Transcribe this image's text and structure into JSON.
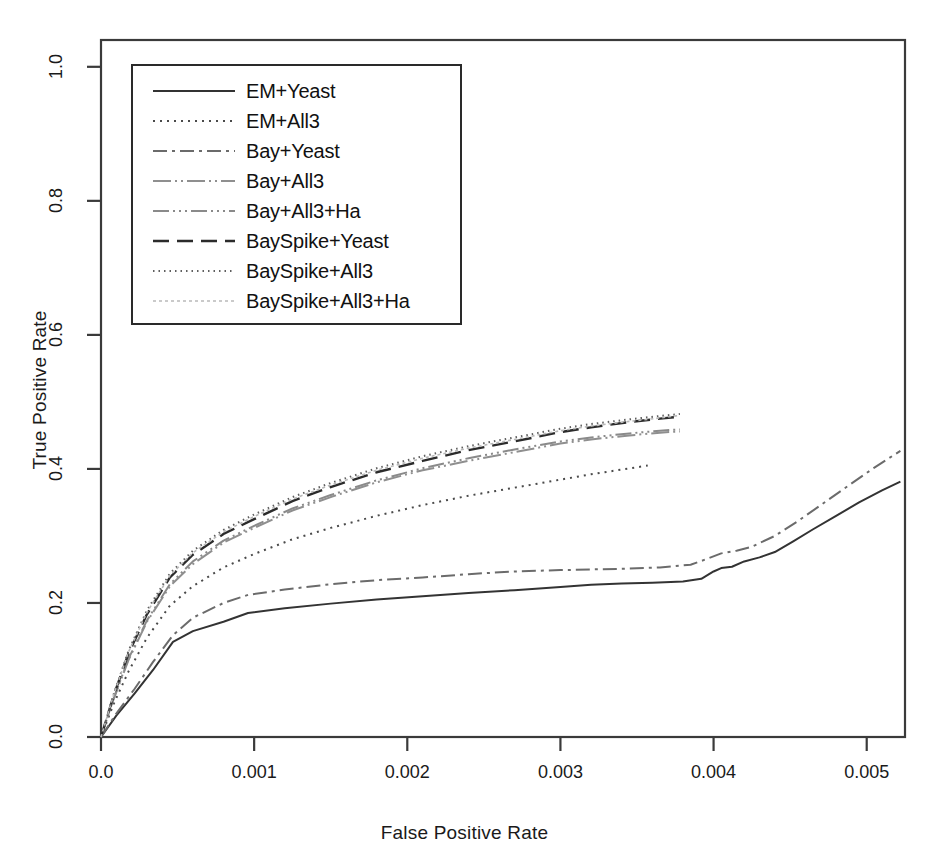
{
  "chart_data": {
    "type": "line",
    "title": "",
    "xlabel": "False Positive Rate",
    "ylabel": "True Positive Rate",
    "xlim": [
      0.0,
      0.00525
    ],
    "ylim": [
      0.0,
      1.04
    ],
    "grid": false,
    "legend_position": "top-left",
    "xticks": [
      0.0,
      0.001,
      0.002,
      0.003,
      0.004,
      0.005
    ],
    "xtick_labels": [
      "0.0",
      "0.001",
      "0.002",
      "0.003",
      "0.004",
      "0.005"
    ],
    "yticks": [
      0.0,
      0.2,
      0.4,
      0.6,
      0.8,
      1.0
    ],
    "ytick_labels": [
      "0.0",
      "0.2",
      "0.4",
      "0.6",
      "0.8",
      "1.0"
    ],
    "series": [
      {
        "name": "EM+Yeast",
        "style": "solid",
        "color": "#333333",
        "width": 2.0,
        "dash": "",
        "x": [
          0.0,
          0.0001,
          0.00022,
          0.00034,
          0.00047,
          0.0006,
          0.0008,
          0.00096,
          0.0012,
          0.0015,
          0.0018,
          0.0021,
          0.0024,
          0.0027,
          0.003,
          0.0032,
          0.0034,
          0.0036,
          0.0038,
          0.00392,
          0.004,
          0.00405,
          0.00412,
          0.0042,
          0.0043,
          0.0044,
          0.00452,
          0.00465,
          0.0048,
          0.00495,
          0.0051,
          0.00522
        ],
        "y": [
          0.0,
          0.032,
          0.065,
          0.1,
          0.142,
          0.158,
          0.172,
          0.185,
          0.192,
          0.199,
          0.205,
          0.21,
          0.215,
          0.219,
          0.224,
          0.227,
          0.229,
          0.23,
          0.232,
          0.236,
          0.247,
          0.252,
          0.254,
          0.262,
          0.268,
          0.276,
          0.292,
          0.31,
          0.33,
          0.35,
          0.368,
          0.381
        ]
      },
      {
        "name": "EM+All3",
        "style": "dotted",
        "color": "#4a4a4a",
        "width": 2.0,
        "dash": "2,5",
        "x": [
          0.0,
          8e-05,
          0.00018,
          0.0003,
          0.00045,
          0.0006,
          0.0008,
          0.001,
          0.00125,
          0.0015,
          0.0018,
          0.0021,
          0.0024,
          0.0027,
          0.003,
          0.0032,
          0.0034,
          0.00357
        ],
        "y": [
          0.0,
          0.048,
          0.098,
          0.148,
          0.196,
          0.225,
          0.253,
          0.273,
          0.295,
          0.312,
          0.33,
          0.346,
          0.36,
          0.372,
          0.384,
          0.392,
          0.399,
          0.405
        ]
      },
      {
        "name": "Bay+Yeast",
        "style": "dashdot",
        "color": "#6b6b6b",
        "width": 2.0,
        "dash": "14,5,3,5",
        "x": [
          0.0,
          0.0001,
          0.00022,
          0.00034,
          0.00047,
          0.0006,
          0.0008,
          0.00096,
          0.0012,
          0.0015,
          0.0018,
          0.0021,
          0.0024,
          0.0027,
          0.003,
          0.0032,
          0.0034,
          0.00365,
          0.00385,
          0.00396,
          0.00405,
          0.00415,
          0.00425,
          0.0044,
          0.00455,
          0.0047,
          0.00488,
          0.00505,
          0.00522
        ],
        "y": [
          0.0,
          0.035,
          0.072,
          0.112,
          0.152,
          0.178,
          0.2,
          0.212,
          0.22,
          0.228,
          0.234,
          0.238,
          0.243,
          0.247,
          0.249,
          0.25,
          0.251,
          0.253,
          0.257,
          0.266,
          0.274,
          0.278,
          0.284,
          0.3,
          0.322,
          0.346,
          0.375,
          0.402,
          0.427
        ]
      },
      {
        "name": "Bay+All3",
        "style": "longdash-dot",
        "color": "#8f8f8f",
        "width": 2.0,
        "dash": "18,4,2,4,2,4",
        "x": [
          0.0,
          8e-05,
          0.00018,
          0.0003,
          0.00045,
          0.0006,
          0.0008,
          0.001,
          0.00125,
          0.0015,
          0.0018,
          0.0021,
          0.0024,
          0.0027,
          0.003,
          0.0032,
          0.00345,
          0.00365,
          0.00378
        ],
        "y": [
          0.0,
          0.055,
          0.115,
          0.172,
          0.225,
          0.258,
          0.29,
          0.312,
          0.338,
          0.358,
          0.38,
          0.398,
          0.412,
          0.425,
          0.438,
          0.444,
          0.45,
          0.454,
          0.456
        ]
      },
      {
        "name": "Bay+All3+Ha",
        "style": "dashdotdot",
        "color": "#8a8a8a",
        "width": 2.0,
        "dash": "16,4,2,4,2,4,2,4",
        "x": [
          0.0,
          8e-05,
          0.00018,
          0.0003,
          0.00045,
          0.0006,
          0.0008,
          0.001,
          0.00125,
          0.0015,
          0.0018,
          0.0021,
          0.0024,
          0.0027,
          0.003,
          0.0032,
          0.00345,
          0.00365,
          0.00378
        ],
        "y": [
          0.0,
          0.056,
          0.117,
          0.174,
          0.228,
          0.262,
          0.293,
          0.315,
          0.341,
          0.361,
          0.383,
          0.401,
          0.416,
          0.429,
          0.441,
          0.447,
          0.453,
          0.457,
          0.459
        ]
      },
      {
        "name": "BaySpike+Yeast",
        "style": "dashed",
        "color": "#2b2b2b",
        "width": 2.4,
        "dash": "16,8",
        "x": [
          0.0,
          8e-05,
          0.00018,
          0.0003,
          0.00045,
          0.0006,
          0.0008,
          0.001,
          0.00125,
          0.0015,
          0.0018,
          0.0021,
          0.0024,
          0.0027,
          0.003,
          0.0032,
          0.00345,
          0.00365,
          0.00378
        ],
        "y": [
          0.0,
          0.06,
          0.125,
          0.183,
          0.238,
          0.272,
          0.303,
          0.325,
          0.352,
          0.373,
          0.395,
          0.412,
          0.428,
          0.441,
          0.455,
          0.462,
          0.47,
          0.475,
          0.478
        ]
      },
      {
        "name": "BaySpike+All3",
        "style": "finedotted",
        "color": "#5f5f5f",
        "width": 2.0,
        "dash": "1.5,4",
        "x": [
          0.0,
          8e-05,
          0.00018,
          0.0003,
          0.00045,
          0.0006,
          0.0008,
          0.001,
          0.00125,
          0.0015,
          0.0018,
          0.0021,
          0.0024,
          0.0027,
          0.003,
          0.0032,
          0.00345,
          0.00365,
          0.00378
        ],
        "y": [
          0.0,
          0.062,
          0.129,
          0.189,
          0.244,
          0.278,
          0.309,
          0.332,
          0.358,
          0.379,
          0.401,
          0.419,
          0.434,
          0.447,
          0.46,
          0.467,
          0.474,
          0.479,
          0.482
        ]
      },
      {
        "name": "BaySpike+All3+Ha",
        "style": "faint",
        "color": "#b9b9b9",
        "width": 1.6,
        "dash": "3,3",
        "x": [
          0.0,
          8e-05,
          0.00018,
          0.0003,
          0.00045,
          0.0006,
          0.0008,
          0.001,
          0.00125,
          0.0015,
          0.0018,
          0.0021,
          0.0024,
          0.0027,
          0.003,
          0.0032,
          0.00345,
          0.00365,
          0.00378
        ],
        "y": [
          0.0,
          0.061,
          0.127,
          0.186,
          0.241,
          0.275,
          0.306,
          0.329,
          0.355,
          0.376,
          0.398,
          0.416,
          0.431,
          0.444,
          0.457,
          0.464,
          0.471,
          0.476,
          0.48
        ]
      }
    ]
  },
  "legend": {
    "entries": [
      {
        "label": "EM+Yeast"
      },
      {
        "label": "EM+All3"
      },
      {
        "label": "Bay+Yeast"
      },
      {
        "label": "Bay+All3"
      },
      {
        "label": "Bay+All3+Ha"
      },
      {
        "label": "BaySpike+Yeast"
      },
      {
        "label": "BaySpike+All3"
      },
      {
        "label": "BaySpike+All3+Ha"
      }
    ]
  },
  "colors": {
    "frame": "#3a3a3a",
    "text": "#1a1a1a",
    "background": "#ffffff"
  }
}
